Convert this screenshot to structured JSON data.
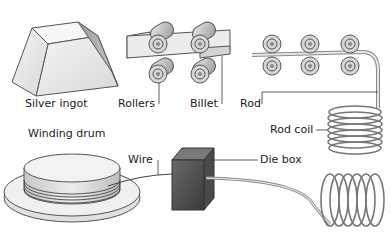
{
  "diagram": {
    "labels": {
      "silver_ingot": "Silver ingot",
      "rollers": "Rollers",
      "billet": "Billet",
      "rod": "Rod",
      "rod_coil": "Rod coil",
      "winding_drum": "Winding drum",
      "wire": "Wire",
      "die_box": "Die box"
    }
  }
}
